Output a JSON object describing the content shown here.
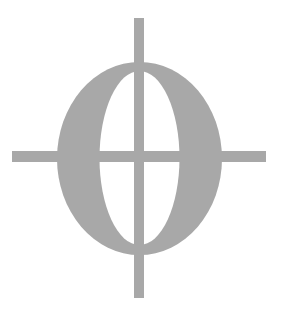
{
  "graphic": {
    "description": "Gray serif letter O with crosshair lines through it",
    "symbol": "crosshair-o-logo",
    "colors": {
      "fill": "#a8a8a8",
      "background": "#ffffff"
    }
  }
}
